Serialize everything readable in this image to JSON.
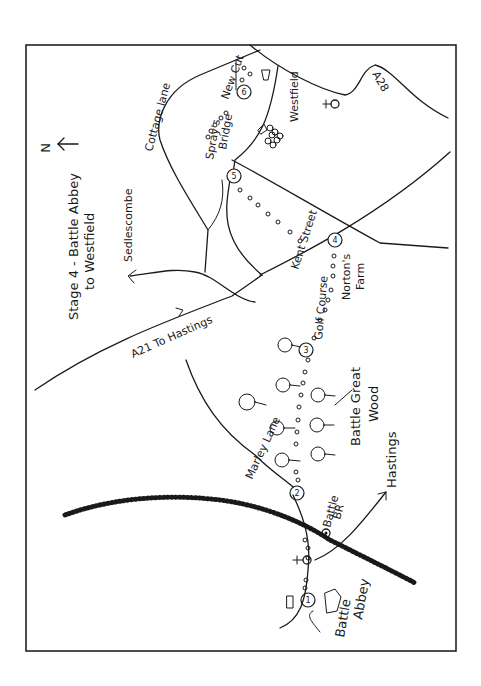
{
  "map": {
    "title_line1": "Stage 4 - Battle Abbey",
    "title_line2": "to Westfield",
    "north_label": "N",
    "colors": {
      "ink": "#1a1a1a",
      "background": "#ffffff",
      "frame": "#222222"
    },
    "roads": {
      "a21": "A21 To Hastings",
      "a28": "A28",
      "cottage_lane": "Cottage lane",
      "sedlescombe": "Sedlescombe",
      "kent_street": "Kent Street",
      "marley_lane": "Marley Lane",
      "hastings": "Hastings"
    },
    "places": {
      "westfield": "Westfield",
      "sprays_bridge_1": "Spray's",
      "sprays_bridge_2": "Bridge",
      "new_cut": "New Cut",
      "nortons_farm_1": "Norton's",
      "nortons_farm_2": "Farm",
      "golf_course": "Golf Course",
      "battle_great_wood_1": "Battle Great",
      "battle_great_wood_2": "Wood",
      "battle_br_1": "Battle",
      "battle_br_2": "BR",
      "battle_abbey_1": "Battle",
      "battle_abbey_2": "Abbey"
    },
    "stops": [
      "1",
      "2",
      "3",
      "4",
      "5",
      "6"
    ]
  }
}
